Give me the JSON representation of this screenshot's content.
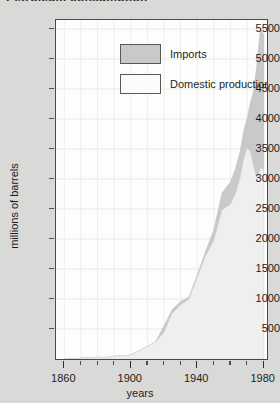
{
  "figure": {
    "clipped_title": "Petroleum consumption",
    "background_color": "#d9d9d7",
    "plot_background": "#fdfdfc"
  },
  "legend": {
    "position": "top-left-inside",
    "entries": [
      {
        "label": "Imports",
        "swatch": "imports-swatch",
        "color": "#c9c9c9"
      },
      {
        "label": "Domestic production",
        "swatch": "domestic-swatch",
        "color": "#fbfbfa"
      }
    ]
  },
  "chart_data": {
    "type": "area",
    "stacked": true,
    "title": "Petroleum consumption",
    "xlabel": "years",
    "ylabel": "millions of barrels",
    "xlim": [
      1855,
      1982
    ],
    "ylim": [
      0,
      5650
    ],
    "grid": true,
    "ytick_labels": [
      "500",
      "1000",
      "1500",
      "2000",
      "2500",
      "3000",
      "3500",
      "4000",
      "4500",
      "5000",
      "5500"
    ],
    "ytick_values": [
      500,
      1000,
      1500,
      2000,
      2500,
      3000,
      3500,
      4000,
      4500,
      5000,
      5500
    ],
    "xtick_major_labels": [
      "1860",
      "1900",
      "1940",
      "1980"
    ],
    "xtick_major_values": [
      1860,
      1900,
      1940,
      1980
    ],
    "xtick_minor_values": [
      1870,
      1880,
      1890,
      1910,
      1920,
      1930,
      1950,
      1960,
      1970
    ],
    "x": [
      1860,
      1865,
      1870,
      1875,
      1880,
      1885,
      1890,
      1895,
      1900,
      1905,
      1910,
      1915,
      1920,
      1925,
      1930,
      1935,
      1940,
      1945,
      1950,
      1955,
      1960,
      1963,
      1966,
      1968,
      1970,
      1972,
      1974,
      1976,
      1978,
      1980
    ],
    "series": [
      {
        "name": "Domestic production",
        "color": "#efefed",
        "values": [
          2,
          5,
          12,
          22,
          28,
          24,
          46,
          53,
          64,
          135,
          210,
          282,
          443,
          764,
          898,
          997,
          1353,
          1714,
          1974,
          2484,
          2575,
          2753,
          3028,
          3329,
          3517,
          3455,
          3203,
          2976,
          3178,
          3150
        ]
      },
      {
        "name": "Imports",
        "color": "#c9c9c9",
        "values": [
          0,
          0,
          0,
          0,
          0,
          0,
          0,
          0,
          0,
          0,
          0,
          5,
          107,
          60,
          62,
          33,
          43,
          74,
          178,
          285,
          372,
          412,
          447,
          472,
          483,
          811,
          1269,
          1935,
          2320,
          2250
        ]
      }
    ],
    "totals": [
      2,
      5,
      12,
      22,
      28,
      24,
      46,
      53,
      64,
      135,
      210,
      287,
      550,
      824,
      960,
      1030,
      1396,
      1788,
      2152,
      2769,
      2947,
      3165,
      3475,
      3801,
      4000,
      4266,
      4472,
      4911,
      5498,
      5400
    ]
  }
}
